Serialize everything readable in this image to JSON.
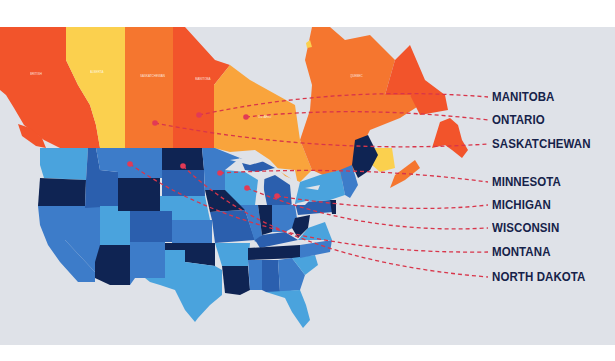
{
  "map": {
    "regions": {
      "canada": [
        "British Columbia",
        "Alberta",
        "Saskatchewan",
        "Manitoba",
        "Ontario",
        "Quebec",
        "Newfoundland and Labrador",
        "New Brunswick",
        "Nova Scotia",
        "Prince Edward Island"
      ],
      "usa": [
        "Washington",
        "Oregon",
        "California",
        "Idaho",
        "Nevada",
        "Montana",
        "Wyoming",
        "Utah",
        "Arizona",
        "Colorado",
        "New Mexico",
        "North Dakota",
        "South Dakota",
        "Nebraska",
        "Kansas",
        "Oklahoma",
        "Texas",
        "Minnesota",
        "Iowa",
        "Missouri",
        "Arkansas",
        "Louisiana",
        "Wisconsin",
        "Illinois",
        "Michigan",
        "Indiana",
        "Ohio",
        "Kentucky",
        "Tennessee",
        "Mississippi",
        "Alabama",
        "Georgia",
        "Florida",
        "South Carolina",
        "North Carolina",
        "Virginia",
        "West Virginia",
        "Pennsylvania",
        "New York",
        "Maine"
      ]
    },
    "colors": {
      "background": "#dfe2e8",
      "canada_red": "#f2542b",
      "canada_orange": "#f5762f",
      "canada_yellow": "#fbd04e",
      "canada_light_orange": "#f9a43c",
      "us_navy": "#0f2453",
      "us_mid": "#3d7cc9",
      "us_light": "#4aa3dd",
      "us_dark_mid": "#2b5fae",
      "dashed_line": "#d8354a",
      "dot": "#e23a55",
      "label_text": "#16224a"
    }
  },
  "labels": [
    {
      "name": "MANITOBA"
    },
    {
      "name": "ONTARIO"
    },
    {
      "name": "SASKATCHEWAN"
    },
    {
      "name": "MINNESOTA"
    },
    {
      "name": "MICHIGAN"
    },
    {
      "name": "WISCONSIN"
    },
    {
      "name": "MONTANA"
    },
    {
      "name": "NORTH DAKOTA"
    }
  ]
}
